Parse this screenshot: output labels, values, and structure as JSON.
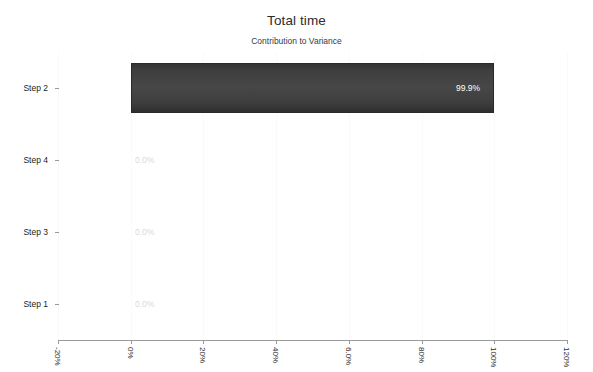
{
  "chart_data": {
    "type": "bar",
    "orientation": "horizontal",
    "title": "Total time",
    "subtitle": "Contribution to Variance",
    "xlabel": "",
    "ylabel": "",
    "categories": [
      "Step 2",
      "Step 4",
      "Step 3",
      "Step 1"
    ],
    "values": [
      99.9,
      0.0,
      0.0,
      0.0
    ],
    "data_labels": [
      "99.9%",
      "0.0%",
      "0.0%",
      "0.0%"
    ],
    "xlim": [
      -20,
      120
    ],
    "xticks": [
      -20,
      0,
      20,
      40,
      60,
      80,
      100,
      120
    ],
    "xtick_labels": [
      "-20%",
      "0%",
      "20%",
      "40%",
      "6.0%",
      "80%",
      "100%",
      "120%"
    ],
    "grid": true,
    "legend": "none",
    "bar_color": "#3d3d3d",
    "bar_label_color": "#ffffff",
    "zero_label_color": "#d9d9d9",
    "axis_color": "#9a9a9a",
    "background": "#ffffff"
  }
}
